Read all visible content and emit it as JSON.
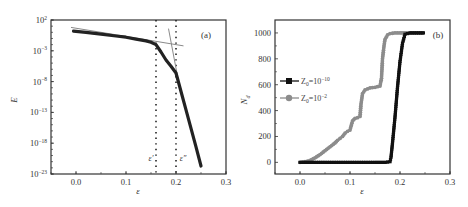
{
  "chart_data": [
    {
      "panel": "(a)",
      "type": "line",
      "title": "",
      "xlabel": "ε",
      "ylabel": "E",
      "xlim": [
        -0.05,
        0.3
      ],
      "ylim_log10": [
        -23,
        2
      ],
      "yscale": "log",
      "xticks": [
        0.0,
        0.1,
        0.2,
        0.3
      ],
      "xtick_labels": [
        "0.0",
        "0.1",
        "0.2",
        "0.3"
      ],
      "yticks_log10": [
        2,
        -3,
        -8,
        -13,
        -18,
        -23
      ],
      "ytick_labels": [
        "10^2",
        "10^-3",
        "10^-8",
        "10^-13",
        "10^-18",
        "10^-23"
      ],
      "grid": false,
      "series": [
        {
          "name": "E",
          "color": "#222222",
          "x": [
            -0.005,
            0.02,
            0.05,
            0.08,
            0.1,
            0.12,
            0.14,
            0.15,
            0.16,
            0.17,
            0.18,
            0.19,
            0.2,
            0.21,
            0.22,
            0.23,
            0.24,
            0.25
          ],
          "log10_y": [
            0.2,
            0.0,
            -0.3,
            -0.6,
            -0.8,
            -1.1,
            -1.4,
            -1.6,
            -2.0,
            -3.2,
            -4.5,
            -5.5,
            -6.6,
            -9.6,
            -12.6,
            -15.6,
            -18.6,
            -21.7
          ]
        }
      ],
      "fit_lines": [
        {
          "name": "fit-low",
          "color": "#8a8a8a",
          "x": [
            -0.01,
            0.215
          ],
          "log10_y": [
            0.8,
            -2.2
          ]
        },
        {
          "name": "fit-high",
          "color": "#8a8a8a",
          "x": [
            0.185,
            0.205
          ],
          "log10_y": [
            0.6,
            -8.0
          ]
        }
      ],
      "vlines": [
        {
          "x": 0.16,
          "label": "ε′",
          "style": "dotted"
        },
        {
          "x": 0.2,
          "label": "ε″",
          "style": "dotted"
        }
      ],
      "annotations": [
        "(a)",
        "ε′",
        "ε″"
      ]
    },
    {
      "panel": "(b)",
      "type": "line",
      "title": "",
      "xlabel": "ε",
      "ylabel": "N_d",
      "xlim": [
        -0.05,
        0.3
      ],
      "ylim": [
        -90,
        1100
      ],
      "xticks": [
        0.0,
        0.1,
        0.2,
        0.3
      ],
      "xtick_labels": [
        "0.0",
        "0.1",
        "0.2",
        "0.3"
      ],
      "yticks": [
        0,
        200,
        400,
        600,
        800,
        1000
      ],
      "ytick_labels": [
        "0",
        "200",
        "400",
        "600",
        "800",
        "1000"
      ],
      "grid": false,
      "legend_position": "center-left",
      "series": [
        {
          "name": "Z0=10^-10",
          "marker": "square",
          "color": "#111111",
          "x": [
            0.0,
            0.02,
            0.05,
            0.1,
            0.15,
            0.17,
            0.18,
            0.182,
            0.185,
            0.19,
            0.195,
            0.2,
            0.205,
            0.21,
            0.22,
            0.25
          ],
          "y": [
            0,
            0,
            0,
            0,
            0,
            0,
            5,
            40,
            150,
            350,
            580,
            780,
            920,
            990,
            1000,
            1000
          ]
        },
        {
          "name": "Z0=10^-2",
          "marker": "circle",
          "color": "#8c8c8c",
          "x": [
            0.0,
            0.01,
            0.02,
            0.03,
            0.04,
            0.05,
            0.06,
            0.07,
            0.075,
            0.08,
            0.085,
            0.09,
            0.095,
            0.1,
            0.105,
            0.11,
            0.115,
            0.12,
            0.122,
            0.125,
            0.13,
            0.14,
            0.15,
            0.16,
            0.163,
            0.165,
            0.168,
            0.17,
            0.175,
            0.18,
            0.19,
            0.2,
            0.22,
            0.25
          ],
          "y": [
            0,
            5,
            15,
            35,
            60,
            90,
            120,
            150,
            170,
            185,
            200,
            225,
            240,
            250,
            320,
            340,
            345,
            355,
            450,
            530,
            560,
            575,
            580,
            590,
            650,
            800,
            900,
            950,
            985,
            995,
            1000,
            1000,
            1000,
            1000
          ]
        }
      ],
      "annotations": [
        "(b)"
      ]
    }
  ],
  "panels": {
    "a": {
      "label": "(a)",
      "xlabel": "ε",
      "ylabel": "E",
      "vline1_label": "ε′",
      "vline2_label": "ε″"
    },
    "b": {
      "label": "(b)",
      "xlabel": "ε",
      "ylabel": "N",
      "ylabel_sub": "d",
      "legend": [
        {
          "base": "Z",
          "sub": "0",
          "eq": "=10",
          "sup": "−10"
        },
        {
          "base": "Z",
          "sub": "0",
          "eq": "=10",
          "sup": "−2"
        }
      ]
    }
  }
}
